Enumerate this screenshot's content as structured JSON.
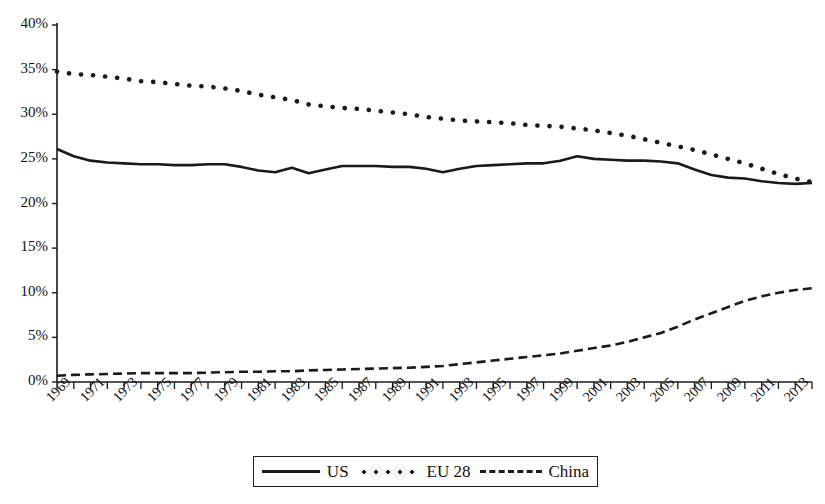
{
  "chart_data": {
    "type": "line",
    "title": "",
    "xlabel": "",
    "ylabel": "",
    "ylim": [
      0,
      40
    ],
    "ytick_values": [
      0,
      5,
      10,
      15,
      20,
      25,
      30,
      35,
      40
    ],
    "ytick_labels": [
      "0%",
      "5%",
      "10%",
      "15%",
      "20%",
      "25%",
      "30%",
      "35%",
      "40%"
    ],
    "grid": false,
    "legend_position": "bottom",
    "x_start": 1969,
    "x_end": 2014,
    "x": [
      1969,
      1970,
      1971,
      1972,
      1973,
      1974,
      1975,
      1976,
      1977,
      1978,
      1979,
      1980,
      1981,
      1982,
      1983,
      1984,
      1985,
      1986,
      1987,
      1988,
      1989,
      1990,
      1991,
      1992,
      1993,
      1994,
      1995,
      1996,
      1997,
      1998,
      1999,
      2000,
      2001,
      2002,
      2003,
      2004,
      2005,
      2006,
      2007,
      2008,
      2009,
      2010,
      2011,
      2012,
      2013,
      2014
    ],
    "xtick_labels": [
      "1969",
      "1971",
      "1973",
      "1975",
      "1977",
      "1979",
      "1981",
      "1983",
      "1985",
      "1987",
      "1989",
      "1991",
      "1993",
      "1995",
      "1997",
      "1999",
      "2001",
      "2003",
      "2005",
      "2007",
      "2009",
      "2011",
      "2013"
    ],
    "series": [
      {
        "name": "US",
        "style": "solid",
        "color": "#1a1a1a",
        "values": [
          26.1,
          25.3,
          24.8,
          24.6,
          24.5,
          24.4,
          24.4,
          24.3,
          24.3,
          24.4,
          24.4,
          24.1,
          23.7,
          23.5,
          24.0,
          23.4,
          23.8,
          24.2,
          24.2,
          24.2,
          24.1,
          24.1,
          23.9,
          23.5,
          23.9,
          24.2,
          24.3,
          24.4,
          24.5,
          24.5,
          24.8,
          25.3,
          25.0,
          24.9,
          24.8,
          24.8,
          24.7,
          24.5,
          23.8,
          23.2,
          22.9,
          22.8,
          22.5,
          22.3,
          22.2,
          22.3
        ]
      },
      {
        "name": "EU 28",
        "style": "dotted",
        "color": "#1a1a1a",
        "values": [
          34.8,
          34.5,
          34.4,
          34.2,
          34.0,
          33.7,
          33.6,
          33.4,
          33.2,
          33.1,
          32.9,
          32.6,
          32.2,
          31.9,
          31.6,
          31.1,
          30.9,
          30.7,
          30.6,
          30.4,
          30.2,
          30.0,
          29.7,
          29.5,
          29.3,
          29.2,
          29.1,
          29.0,
          28.8,
          28.7,
          28.6,
          28.4,
          28.2,
          27.9,
          27.6,
          27.2,
          26.8,
          26.4,
          26.0,
          25.5,
          25.0,
          24.5,
          23.9,
          23.3,
          22.8,
          22.4
        ]
      },
      {
        "name": "China",
        "style": "dashed",
        "color": "#1a1a1a",
        "values": [
          0.7,
          0.8,
          0.85,
          0.9,
          0.95,
          1.0,
          1.0,
          1.0,
          1.0,
          1.05,
          1.1,
          1.15,
          1.15,
          1.2,
          1.2,
          1.3,
          1.35,
          1.4,
          1.45,
          1.5,
          1.55,
          1.6,
          1.7,
          1.8,
          2.0,
          2.2,
          2.4,
          2.6,
          2.8,
          3.0,
          3.2,
          3.5,
          3.8,
          4.1,
          4.5,
          5.0,
          5.5,
          6.2,
          7.0,
          7.7,
          8.4,
          9.1,
          9.6,
          10.0,
          10.3,
          10.5
        ]
      }
    ]
  },
  "legend": {
    "items": [
      {
        "label": "US",
        "style": "solid"
      },
      {
        "label": "EU 28",
        "style": "dotted"
      },
      {
        "label": "China",
        "style": "dashed"
      }
    ]
  }
}
